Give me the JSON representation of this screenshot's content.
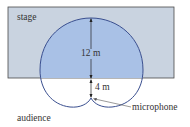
{
  "diagram": {
    "stage_label": "stage",
    "audience_label": "audience",
    "microphone_label": "microphone",
    "front_distance": "12 m",
    "back_distance": "4 m",
    "colors": {
      "stage_fill": "#c9d3e0",
      "stage_border": "#4a4a4a",
      "pickup_fill": "#a9c1e6",
      "curve_stroke": "#3a4f8f",
      "text": "#333333"
    },
    "shape": "cardioid"
  }
}
